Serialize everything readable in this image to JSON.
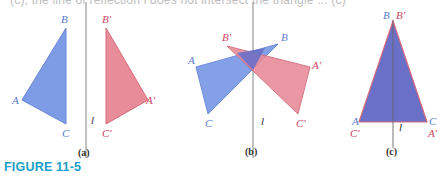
{
  "top_text": "(c), the line of reflection l does not intersect the triangle ... (c)",
  "caption": "FIGURE 11-5",
  "colors": {
    "blue_fill": "#7e9be6",
    "blue_stroke": "#6a86d8",
    "red_fill": "#e88c9a",
    "red_stroke": "#d46a7c",
    "overlap_fill": "#6a70c8",
    "blue_label": "#5a7ad0",
    "red_label": "#cc4466",
    "line": "#777777",
    "caption": "#1aa0c8"
  },
  "panels": [
    {
      "id": "a",
      "sublabel": "(a)",
      "line_label": "l",
      "original": {
        "A": "A",
        "B": "B",
        "C": "C"
      },
      "image": {
        "A": "A′",
        "B": "B′",
        "C": "C′"
      }
    },
    {
      "id": "b",
      "sublabel": "(b)",
      "line_label": "l",
      "original": {
        "A": "A",
        "B": "B",
        "C": "C"
      },
      "image": {
        "A": "A′",
        "B": "B′",
        "C": "C′"
      }
    },
    {
      "id": "c",
      "sublabel": "(c)",
      "line_label": "l",
      "original": {
        "A": "A",
        "B": "B",
        "C": "C"
      },
      "image": {
        "A": "A′",
        "B": "B′",
        "C": "C′"
      }
    }
  ]
}
